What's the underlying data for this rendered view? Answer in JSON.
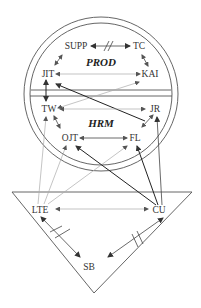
{
  "diagram": {
    "sections": {
      "top": "PROD",
      "middle": "HRM"
    },
    "nodes": {
      "supp": "SUPP",
      "tc": "TC",
      "jit": "JIT",
      "kai": "KAI",
      "tw": "TW",
      "jr": "JR",
      "ojt": "OJT",
      "fl": "FL",
      "lte": "LTE",
      "cu": "CU",
      "sb": "SB"
    },
    "edges": [
      {
        "from": "SUPP",
        "to": "TC",
        "type": "bidirectional",
        "broken": true
      },
      {
        "from": "SUPP",
        "to": "JIT",
        "type": "bidirectional"
      },
      {
        "from": "TC",
        "to": "KAI",
        "type": "bidirectional"
      },
      {
        "from": "JIT",
        "to": "KAI",
        "type": "bidirectional"
      },
      {
        "from": "JIT",
        "to": "TW",
        "type": "bidirectional"
      },
      {
        "from": "JR",
        "to": "JIT",
        "type": "directed"
      },
      {
        "from": "TW",
        "to": "KAI",
        "type": "bidirectional"
      },
      {
        "from": "TW",
        "to": "JR",
        "type": "bidirectional"
      },
      {
        "from": "TW",
        "to": "OJT",
        "type": "bidirectional"
      },
      {
        "from": "FL",
        "to": "JR",
        "type": "bidirectional"
      },
      {
        "from": "OJT",
        "to": "FL",
        "type": "bidirectional"
      },
      {
        "from": "LTE",
        "to": "TW",
        "type": "directed"
      },
      {
        "from": "LTE",
        "to": "OJT",
        "type": "directed"
      },
      {
        "from": "LTE",
        "to": "FL",
        "type": "directed"
      },
      {
        "from": "CU",
        "to": "OJT",
        "type": "directed"
      },
      {
        "from": "CU",
        "to": "FL",
        "type": "directed"
      },
      {
        "from": "CU",
        "to": "JR",
        "type": "directed"
      },
      {
        "from": "LTE",
        "to": "CU",
        "type": "bidirectional"
      },
      {
        "from": "LTE",
        "to": "SB",
        "type": "bidirectional",
        "broken": true
      },
      {
        "from": "CU",
        "to": "SB",
        "type": "bidirectional",
        "broken": true
      }
    ]
  }
}
